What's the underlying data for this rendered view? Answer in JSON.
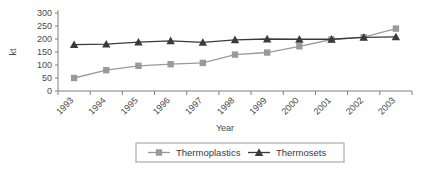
{
  "chart_data": {
    "type": "line",
    "title": "",
    "xlabel": "Year",
    "ylabel": "kt",
    "categories": [
      "1993",
      "1994",
      "1995",
      "1996",
      "1997",
      "1998",
      "1999",
      "2000",
      "2001",
      "2002",
      "2003"
    ],
    "series": [
      {
        "name": "Thermoplastics",
        "marker": "square",
        "color": "#9a9a9a",
        "values": [
          50,
          80,
          97,
          103,
          108,
          140,
          148,
          172,
          198,
          207,
          240
        ]
      },
      {
        "name": "Thermosets",
        "marker": "triangle",
        "color": "#3a3a3a",
        "values": [
          178,
          180,
          188,
          193,
          187,
          197,
          200,
          199,
          199,
          206,
          208
        ]
      }
    ],
    "ylim": [
      0,
      300
    ],
    "ytick_values": [
      0,
      50,
      100,
      150,
      200,
      250,
      300
    ],
    "ytick_labels": [
      "0",
      "50",
      "100",
      "150",
      "200",
      "250",
      "300"
    ],
    "grid": false,
    "legend_position": "bottom",
    "xtick_rotation": -45
  },
  "axes": {
    "y_title": "kt",
    "x_title": "Year"
  },
  "legend": {
    "entries": [
      {
        "label": "Thermoplastics",
        "marker_icon": "square-marker-icon",
        "color": "#9a9a9a"
      },
      {
        "label": "Thermosets",
        "marker_icon": "triangle-marker-icon",
        "color": "#3a3a3a"
      }
    ]
  },
  "colors": {
    "thermoplastics": "#9a9a9a",
    "thermosets": "#3a3a3a",
    "axis": "#808080",
    "legend_border": "#9a9a9a",
    "background": "#ffffff"
  }
}
